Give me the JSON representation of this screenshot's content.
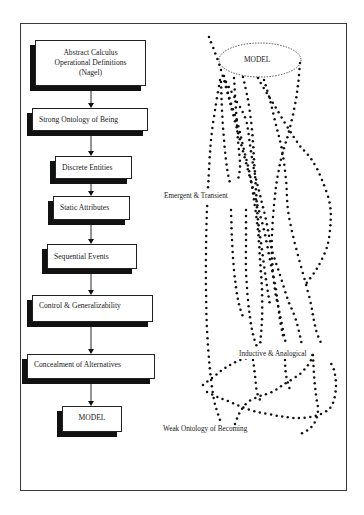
{
  "flowchart": {
    "steps": [
      {
        "label_lines": [
          "Abstract Calculus",
          "Operational Definitions",
          "(Nagel)"
        ]
      },
      {
        "label": "Strong Ontology of Being"
      },
      {
        "label": "Discrete Entities"
      },
      {
        "label": "Static Attributes"
      },
      {
        "label": "Sequential Events"
      },
      {
        "label": "Control & Generalizability"
      },
      {
        "label": "Concealment of Alternatives"
      },
      {
        "label": "MODEL"
      }
    ]
  },
  "weak_side": {
    "model_label": "MODEL",
    "annotations": {
      "emergent": "Emergent & Transient",
      "inductive": "Inductive & Analogical",
      "weak_ontology": "Weak Ontology of Becoming"
    }
  },
  "colors": {
    "ink": "#1a1a1a",
    "background": "#ffffff"
  }
}
